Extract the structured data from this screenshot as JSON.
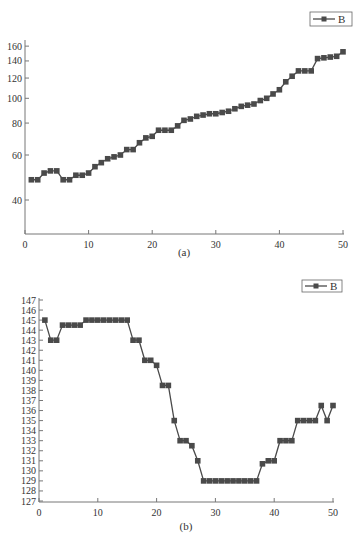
{
  "chart_data": [
    {
      "type": "line",
      "title": "",
      "caption": "(a)",
      "xlabel": "",
      "ylabel": "",
      "yscale": "log",
      "xlim": [
        0,
        50
      ],
      "ylim": [
        30,
        165
      ],
      "x_ticks": [
        0,
        10,
        20,
        30,
        40,
        50
      ],
      "y_ticks": [
        40,
        60,
        80,
        100,
        120,
        140,
        160
      ],
      "grid": false,
      "legend": {
        "position": "top-right",
        "entries": [
          "B"
        ]
      },
      "series": [
        {
          "name": "B",
          "marker": "square",
          "color": "#4a4a4a",
          "x": [
            1,
            2,
            3,
            4,
            5,
            6,
            7,
            8,
            9,
            10,
            11,
            12,
            13,
            14,
            15,
            16,
            17,
            18,
            19,
            20,
            21,
            22,
            23,
            24,
            25,
            26,
            27,
            28,
            29,
            30,
            31,
            32,
            33,
            34,
            35,
            36,
            37,
            38,
            39,
            40,
            41,
            42,
            43,
            44,
            45,
            46,
            47,
            48,
            49,
            50
          ],
          "values": [
            48,
            48,
            51,
            52,
            52,
            48,
            48,
            50,
            50,
            51,
            54,
            56,
            58,
            59,
            60,
            63,
            63,
            67,
            70,
            71,
            75,
            75,
            75,
            78,
            82,
            83,
            85,
            86,
            87,
            87,
            88,
            89,
            91,
            93,
            94,
            95,
            98,
            100,
            104,
            108,
            116,
            122,
            128,
            128,
            128,
            143,
            144,
            145,
            146,
            152
          ]
        }
      ]
    },
    {
      "type": "line",
      "title": "",
      "caption": "(b)",
      "xlabel": "",
      "ylabel": "",
      "xlim": [
        0,
        50
      ],
      "ylim": [
        127,
        147
      ],
      "x_ticks": [
        0,
        10,
        20,
        30,
        40,
        50
      ],
      "y_ticks": [
        127,
        128,
        129,
        130,
        131,
        132,
        133,
        134,
        135,
        136,
        137,
        138,
        139,
        140,
        141,
        142,
        143,
        144,
        145,
        146,
        147
      ],
      "grid": false,
      "legend": {
        "position": "top-right",
        "entries": [
          "B"
        ]
      },
      "series": [
        {
          "name": "B",
          "marker": "square",
          "color": "#4a4a4a",
          "x": [
            1,
            2,
            3,
            4,
            5,
            6,
            7,
            8,
            9,
            10,
            11,
            12,
            13,
            14,
            15,
            16,
            17,
            18,
            19,
            20,
            21,
            22,
            23,
            24,
            25,
            26,
            27,
            28,
            29,
            30,
            31,
            32,
            33,
            34,
            35,
            36,
            37,
            38,
            39,
            40,
            41,
            42,
            43,
            44,
            45,
            46,
            47,
            48,
            49,
            50
          ],
          "values": [
            145,
            143,
            143,
            144.5,
            144.5,
            144.5,
            144.5,
            145,
            145,
            145,
            145,
            145,
            145,
            145,
            145,
            143,
            143,
            141,
            141,
            140.5,
            138.5,
            138.5,
            135,
            133,
            133,
            132.5,
            131,
            129,
            129,
            129,
            129,
            129,
            129,
            129,
            129,
            129,
            129,
            130.7,
            131,
            131,
            133,
            133,
            133,
            135,
            135,
            135,
            135,
            136.5,
            135,
            136.5
          ]
        }
      ]
    }
  ]
}
